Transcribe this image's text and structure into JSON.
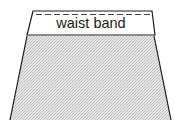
{
  "diagram": {
    "parts": [
      {
        "id": "waist-band",
        "label": "waist band"
      },
      {
        "id": "skirt-body",
        "label": ""
      }
    ],
    "colors": {
      "line": "#1a1a1a",
      "band_fill": "#ffffff",
      "body_fill": "#dcdcdc",
      "stitch": "#444444"
    }
  }
}
